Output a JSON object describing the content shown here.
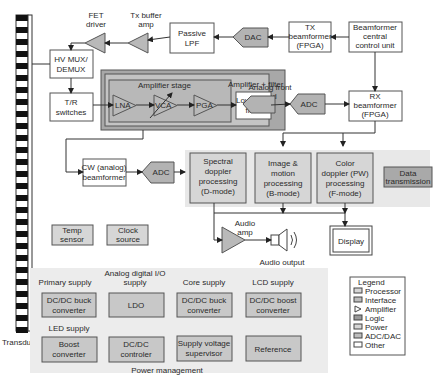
{
  "colors": {
    "background": "#ffffff",
    "processor": "#d6d6d6",
    "interface": "#cfcfcf",
    "amplifier": "#b9b9b9",
    "logic": "#a9a9a9",
    "power": "#c8c8c8",
    "adc_dac": "#b3b3b3",
    "other": "#ffffff",
    "afe_outer": "#a8a8a8",
    "afe_inner": "#c4c4c4",
    "amp_stage": "#b8b8b8",
    "processing_panel": "#e8e8e8",
    "power_panel": "#ececec",
    "stroke": "#555555"
  },
  "transducer": {
    "label": "Transducer"
  },
  "tx_path": {
    "fet_driver": [
      "FET",
      "driver"
    ],
    "tx_buffer_amp": [
      "Tx buffer",
      "amp"
    ],
    "passive_lpf": [
      "Passive",
      "LPF"
    ],
    "dac": "DAC",
    "tx_beamformer": [
      "TX",
      "beamformer",
      "(FPGA)"
    ],
    "central_control": [
      "Beamformer",
      "central",
      "control unit"
    ]
  },
  "front": {
    "hv_mux": [
      "HV MUX/",
      "DEMUX"
    ],
    "tr_switches": [
      "T/R",
      "switches"
    ]
  },
  "analog_front_end": {
    "label": [
      "Analog front",
      "end"
    ],
    "amp_filter_label": "Amplifier + filter",
    "amp_stage_label": "Amplifier stage",
    "lna": "LNA",
    "vca": "VCA",
    "pga": "PGA",
    "lpf": [
      "Low pass",
      "filter"
    ],
    "adc": "ADC"
  },
  "rx_beamformer": [
    "RX",
    "beamformer",
    "(FPGA)"
  ],
  "cw_path": {
    "cw_beamformer": [
      "CW (analog)",
      "beamformer"
    ],
    "adc": "ADC"
  },
  "processing": {
    "spectral": [
      "Spectral",
      "doppler",
      "processing",
      "(D-mode)"
    ],
    "image": [
      "Image &",
      "motion",
      "processing",
      "(B-mode)"
    ],
    "color": [
      "Color",
      "doppler (PW)",
      "processing",
      "(F-mode)"
    ]
  },
  "data_transmission": [
    "Data",
    "transmission"
  ],
  "misc": {
    "temp_sensor": [
      "Temp",
      "sensor"
    ],
    "clock_source": [
      "Clock",
      "source"
    ]
  },
  "audio": {
    "amp_label": [
      "Audio",
      "amp"
    ],
    "output_label": "Audio output"
  },
  "display": "Display",
  "power_management": {
    "title": "Power management",
    "groups": [
      {
        "heading": [
          "Primary supply"
        ],
        "block": [
          "DC/DC buck",
          "converter"
        ]
      },
      {
        "heading": [
          "Analog digital I/O",
          "supply"
        ],
        "block": [
          "LDO"
        ]
      },
      {
        "heading": [
          "Core supply"
        ],
        "block": [
          "DC/DC buck",
          "converter"
        ]
      },
      {
        "heading": [
          "LCD supply"
        ],
        "block": [
          "DC/DC boost",
          "converter"
        ]
      },
      {
        "heading": [
          "LED supply"
        ],
        "block": [
          "Boost",
          "converter"
        ]
      },
      {
        "heading": [],
        "block": [
          "DC/DC",
          "controler"
        ]
      },
      {
        "heading": [],
        "block": [
          "Supply voltage",
          "supervisor"
        ]
      },
      {
        "heading": [],
        "block": [
          "Reference"
        ]
      }
    ]
  },
  "legend": {
    "title": "Legend",
    "items": [
      {
        "label": "Processor",
        "icon": "rect-light"
      },
      {
        "label": "Interface",
        "icon": "rect-mid"
      },
      {
        "label": "Amplifier",
        "icon": "triangle"
      },
      {
        "label": "Logic",
        "icon": "rect-dark"
      },
      {
        "label": "Power",
        "icon": "rect-light"
      },
      {
        "label": "ADC/DAC",
        "icon": "rect-mid"
      },
      {
        "label": "Other",
        "icon": "rect-white"
      }
    ]
  }
}
